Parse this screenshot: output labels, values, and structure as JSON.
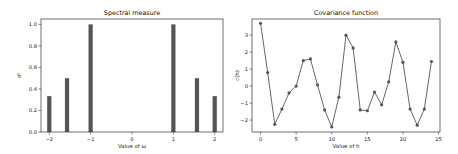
{
  "chart_data": [
    {
      "type": "bar",
      "title": "Spectral measure",
      "xlabel": "Value of ω",
      "ylabel": "σ²",
      "x": [
        -2,
        -1.5708,
        -1,
        1,
        1.5708,
        2
      ],
      "values": [
        0.3333,
        0.5,
        1.0,
        1.0,
        0.5,
        0.3333
      ],
      "xlim": [
        -2.2,
        2.2
      ],
      "ylim": [
        0,
        1.05
      ],
      "xticks": [
        "−2",
        "−1",
        "0",
        "1",
        "2"
      ],
      "xtick_values": [
        -2,
        -1,
        0,
        1,
        2
      ],
      "yticks": [
        "0.0",
        "0.2",
        "0.4",
        "0.6",
        "0.8",
        "1.0"
      ],
      "ytick_values": [
        0,
        0.2,
        0.4,
        0.6,
        0.8,
        1.0
      ],
      "bar_color": "#555555",
      "grid": false
    },
    {
      "type": "line",
      "title": "Covariance function",
      "xlabel": "Value of h",
      "ylabel": "c(h)",
      "x": [
        0,
        1,
        2,
        3,
        4,
        5,
        6,
        7,
        8,
        9,
        10,
        11,
        12,
        13,
        14,
        15,
        16,
        17,
        18,
        19,
        20,
        21,
        22,
        23,
        24
      ],
      "values": [
        3.7,
        0.8,
        -2.25,
        -1.35,
        -0.4,
        0.0,
        1.5,
        1.6,
        0.07,
        -1.4,
        -2.4,
        -0.65,
        3.0,
        2.25,
        -1.4,
        -1.45,
        -0.35,
        -1.1,
        0.25,
        2.6,
        1.4,
        -1.35,
        -2.3,
        -1.35,
        1.45
      ],
      "xlim": [
        -1.2,
        25.2
      ],
      "ylim": [
        -2.7,
        3.95
      ],
      "xticks": [
        "0",
        "5",
        "10",
        "15",
        "20",
        "25"
      ],
      "xtick_values": [
        0,
        5,
        10,
        15,
        20,
        25
      ],
      "yticks": [
        "−2",
        "−1",
        "0",
        "1",
        "2",
        "3"
      ],
      "ytick_values": [
        -2,
        -1,
        0,
        1,
        2,
        3
      ],
      "line_color": "#555555",
      "marker": "o",
      "grid": false
    }
  ]
}
